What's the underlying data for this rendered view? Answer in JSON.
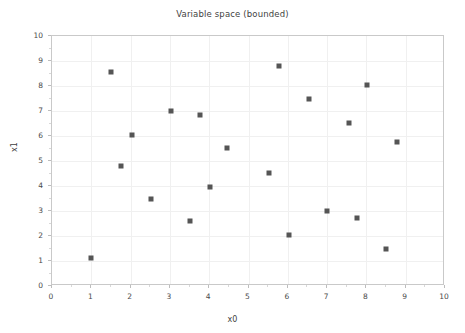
{
  "chart_data": {
    "type": "scatter",
    "title": "Variable space (bounded)",
    "xlabel": "x0",
    "ylabel": "x1",
    "xlim": [
      0,
      10
    ],
    "ylim": [
      0,
      10
    ],
    "xticks": [
      0,
      1,
      2,
      3,
      4,
      5,
      6,
      7,
      8,
      9,
      10
    ],
    "yticks": [
      0,
      1,
      2,
      3,
      4,
      5,
      6,
      7,
      8,
      9,
      10
    ],
    "grid": true,
    "legend": null,
    "marker": {
      "shape": "square",
      "color": "#555555",
      "size_px": 5
    },
    "series": [
      {
        "name": "samples",
        "points": [
          {
            "x": 1.0,
            "y": 1.12
          },
          {
            "x": 1.5,
            "y": 8.56
          },
          {
            "x": 1.76,
            "y": 4.8
          },
          {
            "x": 2.03,
            "y": 6.04
          },
          {
            "x": 2.52,
            "y": 3.48
          },
          {
            "x": 3.03,
            "y": 7.0
          },
          {
            "x": 3.51,
            "y": 2.6
          },
          {
            "x": 3.77,
            "y": 6.84
          },
          {
            "x": 4.02,
            "y": 3.96
          },
          {
            "x": 4.45,
            "y": 5.52
          },
          {
            "x": 5.52,
            "y": 4.52
          },
          {
            "x": 5.78,
            "y": 8.8
          },
          {
            "x": 6.03,
            "y": 2.04
          },
          {
            "x": 6.54,
            "y": 7.48
          },
          {
            "x": 7.0,
            "y": 3.0
          },
          {
            "x": 7.56,
            "y": 6.52
          },
          {
            "x": 7.76,
            "y": 2.72
          },
          {
            "x": 8.02,
            "y": 8.04
          },
          {
            "x": 8.5,
            "y": 1.48
          },
          {
            "x": 8.78,
            "y": 5.76
          }
        ]
      }
    ],
    "colors": {
      "marker": "#555555",
      "axis": "#c9c9c9",
      "grid": "#f0f0f0",
      "text": "#3f3f3f",
      "background": "#ffffff"
    }
  }
}
